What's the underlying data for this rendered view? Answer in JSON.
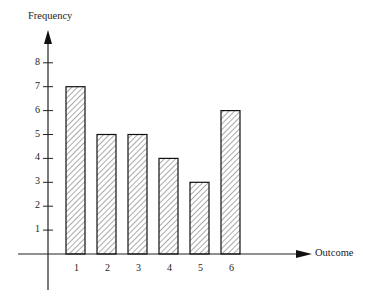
{
  "chart_data": {
    "type": "bar",
    "title": "",
    "xlabel": "Outcome",
    "ylabel": "Frequency",
    "categories": [
      "1",
      "2",
      "3",
      "4",
      "5",
      "6"
    ],
    "values": [
      7,
      5,
      5,
      4,
      3,
      6
    ],
    "ylim": [
      0,
      8
    ],
    "yticks": [
      "1",
      "2",
      "3",
      "4",
      "5",
      "6",
      "7",
      "8"
    ],
    "grid": false,
    "legend": null,
    "bar_fill": "hatched"
  }
}
